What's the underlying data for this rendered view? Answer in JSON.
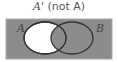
{
  "title": {
    "set": "A'",
    "label": "(not A)"
  },
  "diagram": {
    "type": "venn",
    "shaded_region": "complement of A",
    "sets": [
      {
        "name": "A",
        "label": "A"
      },
      {
        "name": "B",
        "label": "B"
      }
    ],
    "colors": {
      "shaded": "#8c8c8c",
      "unshaded": "#ffffff",
      "outline": "#333333"
    }
  }
}
